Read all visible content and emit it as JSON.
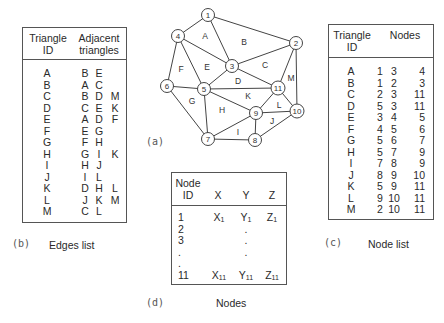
{
  "graph": {
    "label": "(a)",
    "nodes": [
      {
        "id": "1",
        "x": 208,
        "y": 15
      },
      {
        "id": "2",
        "x": 296,
        "y": 43
      },
      {
        "id": "3",
        "x": 232,
        "y": 66
      },
      {
        "id": "4",
        "x": 178,
        "y": 36
      },
      {
        "id": "5",
        "x": 204,
        "y": 89
      },
      {
        "id": "6",
        "x": 167,
        "y": 86
      },
      {
        "id": "7",
        "x": 208,
        "y": 139
      },
      {
        "id": "8",
        "x": 255,
        "y": 140
      },
      {
        "id": "9",
        "x": 256,
        "y": 113
      },
      {
        "id": "10",
        "x": 297,
        "y": 111
      },
      {
        "id": "11",
        "x": 278,
        "y": 88
      }
    ],
    "triangle_labels": [
      {
        "id": "A",
        "x": 205,
        "y": 39
      },
      {
        "id": "B",
        "x": 244,
        "y": 45
      },
      {
        "id": "C",
        "x": 265,
        "y": 68
      },
      {
        "id": "D",
        "x": 238,
        "y": 84
      },
      {
        "id": "E",
        "x": 207,
        "y": 70
      },
      {
        "id": "F",
        "x": 181,
        "y": 72
      },
      {
        "id": "G",
        "x": 192,
        "y": 104
      },
      {
        "id": "H",
        "x": 222,
        "y": 113
      },
      {
        "id": "I",
        "x": 238,
        "y": 135
      },
      {
        "id": "J",
        "x": 272,
        "y": 124
      },
      {
        "id": "K",
        "x": 248,
        "y": 99
      },
      {
        "id": "L",
        "x": 279,
        "y": 108
      },
      {
        "id": "M",
        "x": 291,
        "y": 81
      }
    ]
  },
  "edges_list": {
    "label": "(b)",
    "caption": "Edges list",
    "headers": {
      "col1_line1": "Triangle",
      "col1_line2": "ID",
      "col2_line1": "Adjacent",
      "col2_line2": "triangles"
    },
    "rows": [
      {
        "id": "A",
        "adj": [
          "B",
          "E",
          ""
        ]
      },
      {
        "id": "B",
        "adj": [
          "A",
          "C",
          ""
        ]
      },
      {
        "id": "C",
        "adj": [
          "B",
          "D",
          "M"
        ]
      },
      {
        "id": "D",
        "adj": [
          "C",
          "E",
          "K"
        ]
      },
      {
        "id": "E",
        "adj": [
          "A",
          "D",
          "F"
        ]
      },
      {
        "id": "F",
        "adj": [
          "E",
          "G",
          ""
        ]
      },
      {
        "id": "G",
        "adj": [
          "F",
          "H",
          ""
        ]
      },
      {
        "id": "H",
        "adj": [
          "G",
          "I",
          "K"
        ]
      },
      {
        "id": "I",
        "adj": [
          "H",
          "J",
          ""
        ]
      },
      {
        "id": "J",
        "adj": [
          "I",
          "L",
          ""
        ]
      },
      {
        "id": "K",
        "adj": [
          "D",
          "H",
          "L"
        ]
      },
      {
        "id": "L",
        "adj": [
          "J",
          "K",
          "M"
        ]
      },
      {
        "id": "M",
        "adj": [
          "C",
          "L",
          ""
        ]
      }
    ]
  },
  "node_list": {
    "label": "(c)",
    "caption": "Node list",
    "headers": {
      "col1_line1": "Triangle",
      "col1_line2": "ID",
      "col2": "Nodes"
    },
    "rows": [
      {
        "id": "A",
        "n": [
          "1",
          "3",
          "4"
        ]
      },
      {
        "id": "B",
        "n": [
          "1",
          "2",
          "3"
        ]
      },
      {
        "id": "C",
        "n": [
          "2",
          "3",
          "11"
        ]
      },
      {
        "id": "D",
        "n": [
          "5",
          "3",
          "11"
        ]
      },
      {
        "id": "E",
        "n": [
          "3",
          "4",
          "5"
        ]
      },
      {
        "id": "F",
        "n": [
          "4",
          "5",
          "6"
        ]
      },
      {
        "id": "G",
        "n": [
          "5",
          "6",
          "7"
        ]
      },
      {
        "id": "H",
        "n": [
          "5",
          "7",
          "9"
        ]
      },
      {
        "id": "I",
        "n": [
          "7",
          "8",
          "9"
        ]
      },
      {
        "id": "J",
        "n": [
          "8",
          "9",
          "10"
        ]
      },
      {
        "id": "K",
        "n": [
          "5",
          "9",
          "11"
        ]
      },
      {
        "id": "L",
        "n": [
          "9",
          "10",
          "11"
        ]
      },
      {
        "id": "M",
        "n": [
          "2",
          "10",
          "11"
        ]
      }
    ]
  },
  "nodes_table": {
    "label": "(d)",
    "caption": "Nodes",
    "headers": {
      "id_line1": "Node",
      "id_line2": "ID",
      "x": "X",
      "y": "Y",
      "z": "Z"
    },
    "rows": [
      {
        "id": "1",
        "x": "X",
        "xs": "1",
        "y": "Y",
        "ys": "1",
        "z": "Z",
        "zs": "1"
      },
      {
        "id": "2",
        "x": "",
        "xs": "",
        "y": ".",
        "ys": "",
        "z": "",
        "zs": ""
      },
      {
        "id": "3",
        "x": "",
        "xs": "",
        "y": ".",
        "ys": "",
        "z": "",
        "zs": ""
      },
      {
        "id": ".",
        "x": "",
        "xs": "",
        "y": ".",
        "ys": "",
        "z": "",
        "zs": ""
      },
      {
        "id": ".",
        "x": "",
        "xs": "",
        "y": "",
        "ys": "",
        "z": "",
        "zs": ""
      },
      {
        "id": "11",
        "x": "X",
        "xs": "11",
        "y": "Y",
        "ys": "11",
        "z": "Z",
        "zs": "11"
      }
    ]
  }
}
